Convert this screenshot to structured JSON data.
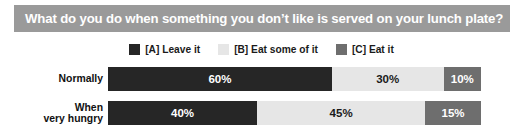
{
  "title": {
    "text": "What do you do when something you don’t like is served on your lunch plate?",
    "background": "#9a9a9a",
    "color": "#ffffff"
  },
  "legend": {
    "items": [
      {
        "label": "[A] Leave it",
        "color": "#262626",
        "key": "A"
      },
      {
        "label": "[B] Eat some of it",
        "color": "#e6e6e6",
        "key": "B"
      },
      {
        "label": "[C] Eat it",
        "color": "#6e6e6e",
        "key": "C"
      }
    ]
  },
  "chart_data": {
    "type": "bar",
    "title": "What do you do when something you don’t like is served on your lunch plate?",
    "xlabel": "",
    "ylabel": "",
    "xlim": [
      0,
      100
    ],
    "grid": false,
    "stacked": true,
    "orientation": "horizontal",
    "legend_position": "top-center",
    "categories": [
      "Normally",
      "When\nvery hungry"
    ],
    "series": [
      {
        "name": "[A] Leave it",
        "color": "#262626",
        "text_color": "#ffffff",
        "values": [
          60,
          40
        ],
        "labels": [
          "60%",
          "40%"
        ]
      },
      {
        "name": "[B] Eat some of it",
        "color": "#e6e6e6",
        "text_color": "#1a1a1a",
        "values": [
          30,
          45
        ],
        "labels": [
          "30%",
          "45%"
        ]
      },
      {
        "name": "[C] Eat it",
        "color": "#6e6e6e",
        "text_color": "#ffffff",
        "values": [
          10,
          15
        ],
        "labels": [
          "10%",
          "15%"
        ]
      }
    ],
    "rows": [
      {
        "label": "Normally",
        "segments": [
          {
            "key": "A",
            "value": 60,
            "label": "60%",
            "color": "#262626",
            "text_color": "#ffffff"
          },
          {
            "key": "B",
            "value": 30,
            "label": "30%",
            "color": "#e6e6e6",
            "text_color": "#1a1a1a"
          },
          {
            "key": "C",
            "value": 10,
            "label": "10%",
            "color": "#6e6e6e",
            "text_color": "#ffffff"
          }
        ]
      },
      {
        "label": "When\nvery hungry",
        "segments": [
          {
            "key": "A",
            "value": 40,
            "label": "40%",
            "color": "#262626",
            "text_color": "#ffffff"
          },
          {
            "key": "B",
            "value": 45,
            "label": "45%",
            "color": "#e6e6e6",
            "text_color": "#1a1a1a"
          },
          {
            "key": "C",
            "value": 15,
            "label": "15%",
            "color": "#6e6e6e",
            "text_color": "#ffffff"
          }
        ]
      }
    ]
  }
}
